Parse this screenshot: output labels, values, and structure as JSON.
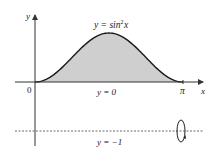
{
  "figure": {
    "type": "region-of-revolution",
    "labels": {
      "y_axis": "y",
      "x_axis": "x",
      "curve": "y = sin",
      "curve_exp": "2",
      "curve_var": "x",
      "origin": "0",
      "pi": "π",
      "lower_bound": "y = 0",
      "axis_of_rotation": "y = −1"
    },
    "colors": {
      "fill": "#cfcfcf",
      "stroke": "#1a1a1a",
      "axis": "#333333"
    }
  },
  "chart_data": {
    "type": "area",
    "title": "",
    "function": "y = sin^2 x",
    "x_range": [
      0,
      3.14159
    ],
    "x_ticks": [
      "0",
      "π"
    ],
    "series": [
      {
        "name": "y = sin²x",
        "x": [
          0,
          0.3927,
          0.7854,
          1.1781,
          1.5708,
          1.9635,
          2.3562,
          2.7489,
          3.14159
        ],
        "values": [
          0,
          0.146,
          0.5,
          0.854,
          1,
          0.854,
          0.5,
          0.146,
          0
        ]
      }
    ],
    "lines": [
      {
        "name": "y = 0",
        "y": 0,
        "style": "solid"
      },
      {
        "name": "y = −1",
        "y": -1,
        "style": "dashed",
        "role": "axis of rotation"
      }
    ],
    "xlabel": "x",
    "ylabel": "y",
    "shaded_region": "between y = sin²x and y = 0 on [0, π]"
  }
}
